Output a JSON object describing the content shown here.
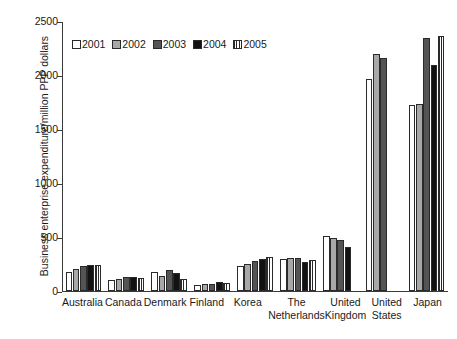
{
  "chart_data": {
    "type": "bar",
    "title": "",
    "xlabel": "",
    "ylabel": "Business enterprise expenditure/million PPP dollars",
    "ylim": [
      0,
      2500
    ],
    "yticks": [
      0,
      500,
      1000,
      1500,
      2000,
      2500
    ],
    "grid": false,
    "legend_position": "top-left inside plot",
    "categories": [
      "Australia",
      "Canada",
      "Denmark",
      "Finland",
      "Korea",
      "The Netherlands",
      "United Kingdom",
      "United States",
      "Japan"
    ],
    "category_lines": [
      [
        "Australia"
      ],
      [
        "Canada"
      ],
      [
        "Denmark"
      ],
      [
        "Finland"
      ],
      [
        "Korea"
      ],
      [
        "The",
        "Netherlands"
      ],
      [
        "United",
        "Kingdom"
      ],
      [
        "United",
        "States"
      ],
      [
        "Japan"
      ]
    ],
    "series": [
      {
        "name": "2001",
        "fill": "white",
        "color": "#ffffff",
        "values": [
          170,
          95,
          175,
          55,
          225,
          290,
          505,
          1960,
          1720
        ]
      },
      {
        "name": "2002",
        "fill": "light-gray",
        "color": "#a8a8a8",
        "values": [
          200,
          110,
          135,
          60,
          245,
          305,
          490,
          2190,
          1725
        ]
      },
      {
        "name": "2003",
        "fill": "dark-gray",
        "color": "#545454",
        "values": [
          225,
          130,
          190,
          65,
          270,
          300,
          465,
          2150,
          2340
        ]
      },
      {
        "name": "2004",
        "fill": "black",
        "color": "#121212",
        "values": [
          240,
          125,
          160,
          80,
          290,
          265,
          405,
          null,
          2090
        ]
      },
      {
        "name": "2005",
        "fill": "vertical-hatch",
        "color": "#2a2a2a",
        "values": [
          235,
          115,
          110,
          75,
          310,
          280,
          null,
          null,
          2355
        ]
      }
    ]
  },
  "legend": {
    "items": [
      {
        "label": "2001",
        "swatch": "swatch-white-icon"
      },
      {
        "label": "2002",
        "swatch": "swatch-light-gray-icon"
      },
      {
        "label": "2003",
        "swatch": "swatch-dark-gray-icon"
      },
      {
        "label": "2004",
        "swatch": "swatch-black-icon"
      },
      {
        "label": "2005",
        "swatch": "swatch-hatched-icon"
      }
    ]
  },
  "axis": {
    "y_title": "Business enterprise expenditure/million PPP dollars",
    "y_tick_labels": [
      "2500",
      "2000",
      "1500",
      "1000",
      "500",
      "0"
    ]
  }
}
